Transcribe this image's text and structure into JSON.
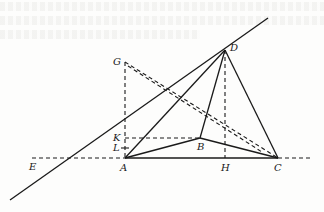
{
  "figure": {
    "type": "geometry-diagram",
    "points": {
      "A": {
        "label": "A",
        "x": 125,
        "y": 158
      },
      "B": {
        "label": "B",
        "x": 200,
        "y": 138
      },
      "C": {
        "label": "C",
        "x": 278,
        "y": 158
      },
      "D": {
        "label": "D",
        "x": 225,
        "y": 50
      },
      "E": {
        "label": "E",
        "x": 38,
        "y": 158
      },
      "G": {
        "label": "G",
        "x": 125,
        "y": 62
      },
      "H": {
        "label": "H",
        "x": 225,
        "y": 158
      },
      "K": {
        "label": "K",
        "x": 125,
        "y": 138
      },
      "L": {
        "label": "L",
        "x": 125,
        "y": 148
      }
    },
    "solid_segments": [
      [
        "A",
        "C"
      ],
      [
        "A",
        "D"
      ],
      [
        "A",
        "B"
      ],
      [
        "B",
        "D"
      ],
      [
        "B",
        "C"
      ],
      [
        "D",
        "C"
      ],
      [
        "E",
        "D"
      ]
    ],
    "dashed_segments": [
      [
        "E",
        "A"
      ],
      [
        "C",
        "extend_right"
      ],
      [
        "G",
        "A"
      ],
      [
        "K",
        "B"
      ],
      [
        "D",
        "H"
      ],
      [
        "G",
        "C"
      ],
      [
        "G",
        "B"
      ]
    ],
    "colors": {
      "ink": "#1a1a1a",
      "paper": "#fdfdfc"
    }
  }
}
